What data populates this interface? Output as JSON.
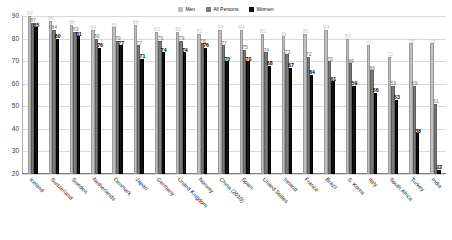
{
  "legend": {
    "position": "top-center",
    "entries": [
      {
        "label": "Men",
        "color": "#bfbfbf",
        "key": "men"
      },
      {
        "label": "All Persons",
        "color": "#7a7a7a",
        "key": "all"
      },
      {
        "label": "Women",
        "color": "#111111",
        "key": "women"
      }
    ]
  },
  "axes": {
    "y_ticks": [
      90,
      80,
      70,
      60,
      50,
      40,
      30,
      20
    ],
    "ylim": [
      20,
      90
    ],
    "grid": true,
    "ylabel": "",
    "xlabel": ""
  },
  "chart_data": {
    "type": "bar",
    "title": "",
    "subtitle": "",
    "xlabel": "",
    "ylabel": "",
    "ylim": [
      20,
      90
    ],
    "grid": true,
    "legend_position": "top-center",
    "categories": [
      "Iceland",
      "Switzerland",
      "Sweden",
      "Netherlands",
      "Denmark",
      "Japan",
      "Germany",
      "United Kingdom",
      "Norway",
      "China (2010)",
      "Spain",
      "United States",
      "Ireland",
      "France",
      "Brazil",
      "S. Korea",
      "Italy",
      "South Africa",
      "Turkey",
      "India"
    ],
    "series": [
      {
        "name": "Men",
        "color": "#bfbfbf",
        "values": [
          90,
          88,
          86,
          84,
          85,
          86,
          83,
          83,
          82,
          84,
          84,
          82,
          81,
          82,
          84,
          80,
          77,
          72,
          78,
          78
        ]
      },
      {
        "name": "All Persons",
        "color": "#7a7a7a",
        "values": [
          87,
          84,
          83,
          80,
          79,
          77,
          79,
          79,
          78,
          77,
          75,
          74,
          73,
          72,
          70,
          69,
          66,
          59,
          59,
          51
        ]
      },
      {
        "name": "Women",
        "color": "#111111",
        "values": [
          85,
          80,
          81,
          76,
          77,
          71,
          74,
          74,
          76,
          70,
          70,
          68,
          67,
          64,
          61,
          59,
          56,
          53,
          38,
          22
        ]
      }
    ]
  }
}
